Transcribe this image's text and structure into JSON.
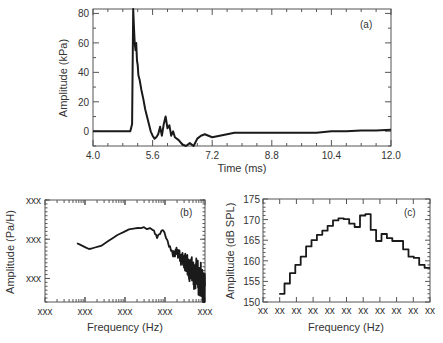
{
  "chart_data": [
    {
      "id": "a",
      "type": "line",
      "panel_label": "(a)",
      "xlabel": "Time (ms)",
      "ylabel": "Amplitude (kPa)",
      "xlim": [
        4.0,
        12.0
      ],
      "ylim": [
        -10,
        83
      ],
      "xticks": [
        "4.0",
        "5.6",
        "7.2",
        "8.8",
        "10.4",
        "12.0"
      ],
      "xtick_values": [
        4.0,
        5.6,
        7.2,
        8.8,
        10.4,
        12.0
      ],
      "yticks": [
        "0",
        "20",
        "40",
        "60",
        "80"
      ],
      "ytick_values": [
        0,
        20,
        40,
        60,
        80
      ],
      "x": [
        4.0,
        5.0,
        5.05,
        5.08,
        5.1,
        5.12,
        5.14,
        5.16,
        5.18,
        5.2,
        5.22,
        5.25,
        5.3,
        5.35,
        5.4,
        5.45,
        5.5,
        5.55,
        5.6,
        5.65,
        5.7,
        5.75,
        5.8,
        5.85,
        5.9,
        5.95,
        6.0,
        6.05,
        6.1,
        6.15,
        6.2,
        6.3,
        6.4,
        6.5,
        6.6,
        6.7,
        6.8,
        6.9,
        7.0,
        7.1,
        7.2,
        7.4,
        7.6,
        7.8,
        8.0,
        8.4,
        8.8,
        9.2,
        9.6,
        10.0,
        10.4,
        10.8,
        11.2,
        11.6,
        12.0
      ],
      "y": [
        0,
        0,
        5,
        83,
        70,
        60,
        55,
        60,
        48,
        45,
        38,
        35,
        28,
        22,
        15,
        10,
        5,
        0,
        -3,
        -5,
        -4,
        -2,
        3,
        -3,
        5,
        10,
        2,
        4,
        -3,
        0,
        -4,
        -6,
        -9,
        -10,
        -8,
        -10,
        -5,
        -3,
        -2,
        -3,
        -4,
        -3,
        -2,
        -1,
        -1,
        -1,
        -1,
        -1,
        -1,
        -1,
        0,
        0,
        0.5,
        0.5,
        1
      ]
    },
    {
      "id": "b",
      "type": "line",
      "panel_label": "(b)",
      "xlabel": "Frequency (Hz)",
      "ylabel": "Amplitude (Pa/H)",
      "xscale": "log",
      "yscale": "log",
      "xticks": [
        "xxx",
        "xxx",
        "xxx",
        "xxx",
        "xxx"
      ],
      "yticks": [
        "xxx",
        "xxx",
        "xxx"
      ],
      "xdecades": [
        0,
        4
      ],
      "ydecades": [
        -0.7,
        1.9
      ],
      "x_log": [
        0.8,
        1.1,
        1.4,
        1.8,
        2.1,
        2.4,
        2.7,
        2.8,
        2.95,
        3.1,
        3.2,
        3.3,
        3.4,
        3.5,
        3.55,
        3.6,
        3.65,
        3.7,
        3.75,
        3.8,
        3.85,
        3.9,
        3.95,
        4.0
      ],
      "y_log": [
        0.8,
        0.65,
        0.73,
        1.0,
        1.15,
        1.2,
        1.15,
        0.95,
        1.15,
        0.75,
        0.5,
        0.6,
        0.4,
        0.35,
        0.25,
        0.1,
        0.2,
        0.0,
        -0.05,
        0.1,
        -0.2,
        -0.1,
        -0.4,
        -0.3
      ]
    },
    {
      "id": "c",
      "type": "step",
      "panel_label": "(c)",
      "xlabel": "Frequency (Hz)",
      "ylabel": "Amplitude (dB SPL)",
      "ylim": [
        150,
        175
      ],
      "yticks": [
        "150",
        "155",
        "160",
        "165",
        "170",
        "175"
      ],
      "ytick_values": [
        150,
        155,
        160,
        165,
        170,
        175
      ],
      "xticks": [
        "xx",
        "xx",
        "xx",
        "xx",
        "xx",
        "xx",
        "xx",
        "xx",
        "xx",
        "xx",
        "xx"
      ],
      "bins": 31,
      "bin_start": 3,
      "values": [
        152,
        154.5,
        157,
        159,
        161,
        163.5,
        165,
        166.3,
        167.3,
        168.5,
        169.8,
        170.3,
        170.1,
        169,
        168.2,
        171,
        171.3,
        167.5,
        164.8,
        166.5,
        165.5,
        164.8,
        164.8,
        162.8,
        161,
        160.7,
        159,
        158.3
      ]
    }
  ]
}
